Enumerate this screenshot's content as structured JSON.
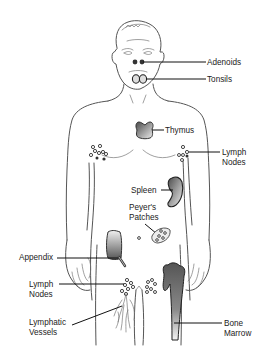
{
  "diagram": {
    "labels": {
      "adenoids": "Adenoids",
      "tonsils": "Tonsils",
      "thymus": "Thymus",
      "lymph_nodes_upper_1": "Lymph",
      "lymph_nodes_upper_2": "Nodes",
      "spleen": "Spleen",
      "peyers_1": "Peyer's",
      "peyers_2": "Patches",
      "appendix": "Appendix",
      "lymph_nodes_lower_1": "Lymph",
      "lymph_nodes_lower_2": "Nodes",
      "lymphatic_1": "Lymphatic",
      "lymphatic_2": "Vessels",
      "bone_1": "Bone",
      "bone_2": "Marrow"
    },
    "colors": {
      "outline": "#555555",
      "organ_dark": "#555555",
      "organ_light": "#f2f2f2",
      "text": "#222222"
    }
  }
}
